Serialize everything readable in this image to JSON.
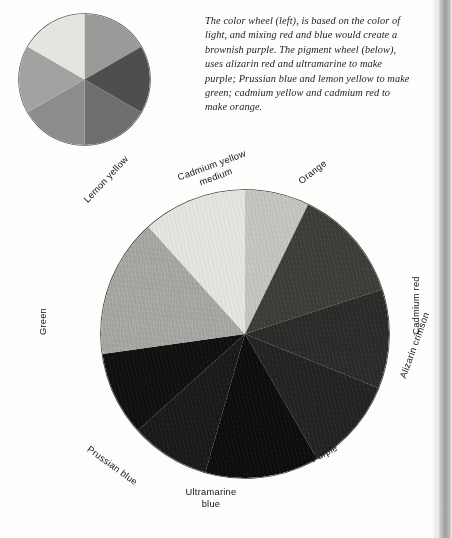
{
  "caption": {
    "text": "The color wheel (left), is based on the color of light, and mixing red and blue would create a brownish purple. The pigment wheel (below), uses alizarin red and ultramarine to make purple; Prussian blue and lemon yellow to make green; cadmium yellow and cadmium red to make orange."
  },
  "light_wheel": {
    "name": "color wheel",
    "caption_reference": "left",
    "sector_count": 6,
    "sectors": [
      {
        "name": "red",
        "start_deg": 0,
        "end_deg": 60,
        "color": "#9a9a98"
      },
      {
        "name": "magenta",
        "start_deg": 60,
        "end_deg": 120,
        "color": "#4e4e4c"
      },
      {
        "name": "blue",
        "start_deg": 120,
        "end_deg": 180,
        "color": "#6e6e6c"
      },
      {
        "name": "cyan",
        "start_deg": 180,
        "end_deg": 240,
        "color": "#8c8c8a"
      },
      {
        "name": "green",
        "start_deg": 240,
        "end_deg": 300,
        "color": "#a2a2a0"
      },
      {
        "name": "yellow",
        "start_deg": 300,
        "end_deg": 360,
        "color": "#e4e4e0"
      }
    ],
    "outline_color": "#5a5a5a"
  },
  "pigment_wheel": {
    "name": "pigment wheel",
    "caption_reference": "below",
    "sector_count": 9,
    "sectors": [
      {
        "label": "Cadmium yellow medium",
        "start_deg": 0,
        "end_deg": 26,
        "color": "#c6c6c0"
      },
      {
        "label": "Orange",
        "start_deg": 26,
        "end_deg": 72,
        "color": "#3d3d3a"
      },
      {
        "label": "Cadmium red",
        "start_deg": 72,
        "end_deg": 112,
        "color": "#2b2b29"
      },
      {
        "label": "Alizarin crimson",
        "start_deg": 112,
        "end_deg": 150,
        "color": "#232321"
      },
      {
        "label": "Purple",
        "start_deg": 150,
        "end_deg": 196,
        "color": "#0d0d0c"
      },
      {
        "label": "Ultramarine blue",
        "start_deg": 196,
        "end_deg": 228,
        "color": "#1a1a19"
      },
      {
        "label": "Prussian blue",
        "start_deg": 228,
        "end_deg": 262,
        "color": "#101010"
      },
      {
        "label": "Green",
        "start_deg": 262,
        "end_deg": 318,
        "color": "#a7a7a3"
      },
      {
        "label": "Lemon yellow",
        "start_deg": 318,
        "end_deg": 360,
        "color": "#e6e6e1"
      }
    ],
    "outline_color": "#3a3a3a"
  },
  "labels": {
    "cadmium_yellow": "Cadmium yellow medium",
    "lemon_yellow": "Lemon yellow",
    "green": "Green",
    "prussian_blue": "Prussian blue",
    "ultramarine_blue": "Ultramarine blue",
    "purple": "Purple",
    "alizarin_crimson": "Alizarin crimson",
    "cadmium_red": "Cadmium red",
    "orange": "Orange"
  },
  "colors": {
    "page_background": "#fdfdfc",
    "text": "#1c1c1c",
    "label_text": "#111111",
    "page_edge_dark": "#9d9d9d"
  }
}
